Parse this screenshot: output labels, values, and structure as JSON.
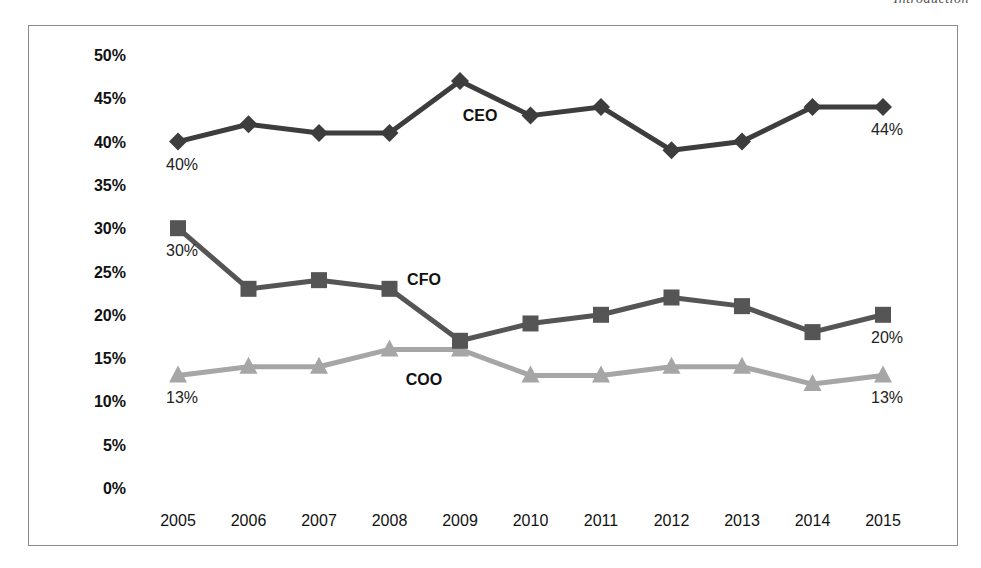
{
  "page": {
    "running_head": "Introduction"
  },
  "chart_data": {
    "type": "line",
    "title": "",
    "xlabel": "",
    "ylabel": "",
    "ylim": [
      0,
      50
    ],
    "grid": false,
    "legend": "inline labels",
    "categories": [
      "2005",
      "2006",
      "2007",
      "2008",
      "2009",
      "2010",
      "2011",
      "2012",
      "2013",
      "2014",
      "2015"
    ],
    "y_ticks": [
      "0%",
      "5%",
      "10%",
      "15%",
      "20%",
      "25%",
      "30%",
      "35%",
      "40%",
      "45%",
      "50%"
    ],
    "series": [
      {
        "name": "CEO",
        "marker": "diamond",
        "color": "#3d3d3d",
        "values": [
          40,
          42,
          41,
          41,
          47,
          43,
          44,
          39,
          40,
          44,
          44
        ],
        "label_pos": {
          "category_index": 4,
          "dx": 20,
          "dy": 40
        },
        "data_labels": [
          {
            "index": 0,
            "text": "40%"
          },
          {
            "index": 10,
            "text": "44%"
          }
        ]
      },
      {
        "name": "CFO",
        "marker": "square",
        "color": "#555555",
        "values": [
          30,
          23,
          24,
          23,
          17,
          19,
          20,
          22,
          21,
          18,
          20
        ],
        "label_pos": {
          "category_index": 4,
          "dx": -36,
          "dy": -56
        },
        "data_labels": [
          {
            "index": 0,
            "text": "30%"
          },
          {
            "index": 10,
            "text": "20%"
          }
        ]
      },
      {
        "name": "COO",
        "marker": "triangle",
        "color": "#a6a6a6",
        "values": [
          13,
          14,
          14,
          16,
          16,
          13,
          13,
          14,
          14,
          12,
          13
        ],
        "label_pos": {
          "category_index": 4,
          "dx": -36,
          "dy": 36
        },
        "data_labels": [
          {
            "index": 0,
            "text": "13%"
          },
          {
            "index": 10,
            "text": "13%"
          }
        ]
      }
    ]
  }
}
